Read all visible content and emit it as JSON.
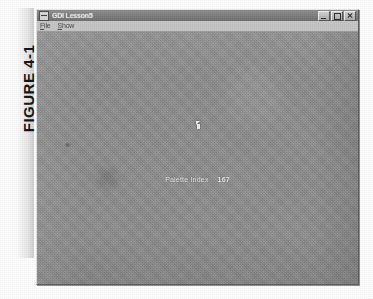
{
  "figure": {
    "label": "FIGURE 4-1"
  },
  "window": {
    "title": "GDI Lesson5",
    "system_menu_icon": "window-menu-icon",
    "controls": [
      {
        "name": "minimize",
        "label": "Minimize"
      },
      {
        "name": "maximize",
        "label": "Maximize"
      },
      {
        "name": "close",
        "label": "Close"
      }
    ]
  },
  "menu": {
    "items": [
      {
        "name": "file",
        "label": "File",
        "mnemonic": "F"
      },
      {
        "name": "show",
        "label": "Show",
        "mnemonic": "S"
      }
    ]
  },
  "client": {
    "background_color": "#8e8e8e",
    "readout": {
      "label": "Palette Index",
      "value": "167"
    },
    "cursor": "mouse-pointer-arrow"
  },
  "colors": {
    "page": "#ffffff",
    "window_face": "#b6b6b6",
    "title_bar": "#7d7d7d",
    "menu_bar": "#c6c6c6",
    "client_fill": "#8e8e8e",
    "readout_text": "#efefef"
  }
}
